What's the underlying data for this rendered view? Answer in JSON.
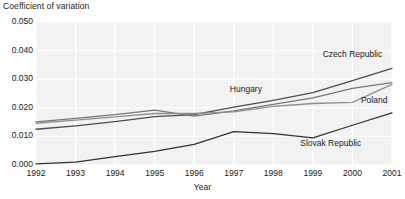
{
  "chart_data": {
    "type": "line",
    "title": "",
    "ylabel": "Coefficient of variation",
    "xlabel": "Year",
    "categories": [
      1992,
      1993,
      1994,
      1995,
      1996,
      1997,
      1998,
      1999,
      2000,
      2001
    ],
    "x_tick_labels": [
      "1992",
      "1993",
      "1994",
      "1995",
      "1996",
      "1997",
      "1998",
      "1999",
      "2000",
      "2001"
    ],
    "y_tick_labels": [
      "0.050",
      "0.040",
      "0.030",
      "0.020",
      "0.010",
      "0.000"
    ],
    "y_ticks": [
      0.05,
      0.04,
      0.03,
      0.02,
      0.01,
      0.0
    ],
    "ylim": [
      0.0,
      0.05
    ],
    "grid": true,
    "legend_position": "inline-labels",
    "series": [
      {
        "name": "Czech Republic",
        "color": "#4d4d4d",
        "values": [
          0.0125,
          0.0137,
          0.0152,
          0.0169,
          0.0176,
          0.0202,
          0.0226,
          0.0253,
          0.0295,
          0.0338
        ],
        "label_x": 2000.0,
        "label_y": 0.0385
      },
      {
        "name": "Hungary",
        "color": "#777777",
        "values": [
          0.0151,
          0.0163,
          0.0176,
          0.0192,
          0.0171,
          0.0189,
          0.0212,
          0.0235,
          0.0268,
          0.0288
        ],
        "label_x": 1996.9,
        "label_y": 0.0262
      },
      {
        "name": "Poland",
        "color": "#8f8f8f",
        "values": [
          0.0146,
          0.0157,
          0.0168,
          0.018,
          0.018,
          0.0186,
          0.0205,
          0.0215,
          0.0219,
          0.0282
        ],
        "label_x": 2000.55,
        "label_y": 0.0225
      },
      {
        "name": "Slovak Republic",
        "color": "#333333",
        "values": [
          0.0004,
          0.001,
          0.0029,
          0.0048,
          0.0072,
          0.0117,
          0.011,
          0.0095,
          0.0139,
          0.0182
        ],
        "label_x": 1999.45,
        "label_y": 0.0072
      }
    ],
    "colors": {
      "plot_background": "#f2f2f2",
      "gridline": "#ffffff",
      "text": "#1a1a1a"
    }
  }
}
